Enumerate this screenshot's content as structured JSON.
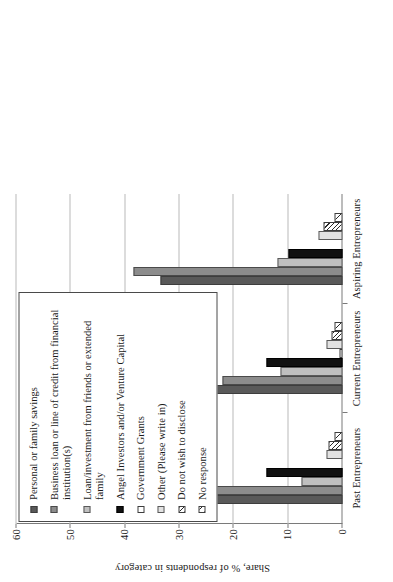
{
  "chart_data": {
    "type": "bar",
    "title": "",
    "subtitle": "",
    "xlabel": "",
    "ylabel": "Share, % of respondents in category",
    "ylim": [
      0,
      60
    ],
    "yticks": [
      "0",
      "10",
      "20",
      "30",
      "40",
      "50",
      "60"
    ],
    "grid": true,
    "legend_position": "top-right",
    "orientation": "vertical-bars-rotated-90ccw",
    "categories": [
      "Past Entrepreneurs",
      "Current Entrepreneurs",
      "Aspiring Entrepreneurs"
    ],
    "series": [
      {
        "name": "Personal or family savings",
        "fill": "f-darkgray",
        "values": [
          44.5,
          49.5,
          33.5
        ]
      },
      {
        "name": "Business loan or line of credit from financial institution(s)",
        "fill": "f-medgray",
        "values": [
          27.0,
          22.0,
          38.5
        ]
      },
      {
        "name": "Loan/investment from friends or extended family",
        "fill": "f-lightgray",
        "values": [
          7.5,
          11.5,
          12.0
        ]
      },
      {
        "name": "Angel Investors and/or Venture Capital",
        "fill": "f-black",
        "values": [
          14.0,
          14.0,
          10.0
        ]
      },
      {
        "name": "Government Grants",
        "fill": "f-white",
        "values": [
          0.0,
          0.5,
          0.0
        ]
      },
      {
        "name": "Other (Please write in)",
        "fill": "f-vlightgray",
        "values": [
          3.0,
          3.0,
          4.5
        ]
      },
      {
        "name": "Do not wish to disclose",
        "fill": "f-hatch",
        "values": [
          2.5,
          2.0,
          3.5
        ]
      },
      {
        "name": "No response",
        "fill": "f-hatch-sparse",
        "values": [
          1.5,
          1.5,
          1.5
        ]
      }
    ]
  },
  "legend": {
    "items": [
      {
        "label": "Personal or family savings",
        "fill": "f-darkgray"
      },
      {
        "label": "Business loan or line of credit from financial institution(s)",
        "fill": "f-medgray"
      },
      {
        "label": "Loan/investment from friends or extended family",
        "fill": "f-lightgray"
      },
      {
        "label": "Angel Investors and/or Venture Capital",
        "fill": "f-black"
      },
      {
        "label": "Government Grants",
        "fill": "f-white"
      },
      {
        "label": "Other (Please write in)",
        "fill": "f-vlightgray"
      },
      {
        "label": "Do not wish to disclose",
        "fill": "f-hatch"
      },
      {
        "label": "No response",
        "fill": "f-hatch-sparse"
      }
    ]
  }
}
